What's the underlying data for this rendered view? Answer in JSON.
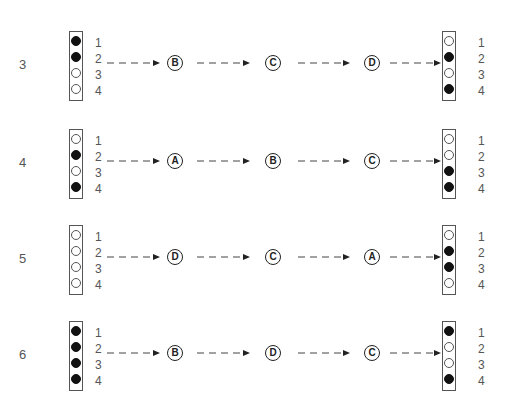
{
  "diagram": {
    "pin_numbers": [
      "1",
      "2",
      "3",
      "4"
    ],
    "legend": {
      "filled": "filled-dot",
      "empty": "empty-dot"
    },
    "colors": {
      "line": "#555555",
      "filled": "#111111",
      "text": "#555555"
    },
    "rows": [
      {
        "label": "3",
        "start": [
          "filled",
          "filled",
          "empty",
          "empty"
        ],
        "steps": [
          "B",
          "C",
          "D"
        ],
        "end": [
          "empty",
          "filled",
          "empty",
          "filled"
        ]
      },
      {
        "label": "4",
        "start": [
          "empty",
          "filled",
          "empty",
          "filled"
        ],
        "steps": [
          "A",
          "B",
          "C"
        ],
        "end": [
          "empty",
          "empty",
          "filled",
          "filled"
        ]
      },
      {
        "label": "5",
        "start": [
          "empty",
          "empty",
          "empty",
          "empty"
        ],
        "steps": [
          "D",
          "C",
          "A"
        ],
        "end": [
          "empty",
          "filled",
          "filled",
          "empty"
        ]
      },
      {
        "label": "6",
        "start": [
          "filled",
          "filled",
          "filled",
          "filled"
        ],
        "steps": [
          "B",
          "D",
          "C"
        ],
        "end": [
          "filled",
          "empty",
          "empty",
          "filled"
        ]
      }
    ]
  }
}
